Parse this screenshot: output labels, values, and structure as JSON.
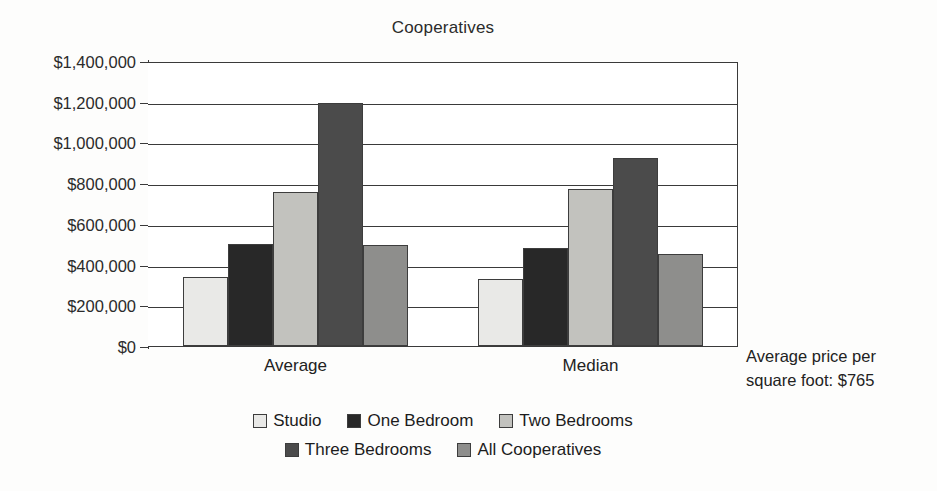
{
  "chart_data": {
    "type": "bar",
    "title": "Cooperatives",
    "xlabel": "",
    "ylabel": "",
    "categories": [
      "Average",
      "Median"
    ],
    "ylim": [
      0,
      1400000
    ],
    "ytick_labels": [
      "$1,400,000",
      "$1,200,000",
      "$1,000,000",
      "$800,000",
      "$600,000",
      "$400,000",
      "$200,000",
      "$0"
    ],
    "ytick_values": [
      1400000,
      1200000,
      1000000,
      800000,
      600000,
      400000,
      200000,
      0
    ],
    "grid": true,
    "legend_position": "bottom",
    "series": [
      {
        "name": "Studio",
        "color": "#e9e9e7",
        "values": [
          340000,
          330000
        ]
      },
      {
        "name": "One Bedroom",
        "color": "#282828",
        "values": [
          500000,
          480000
        ]
      },
      {
        "name": "Two Bedrooms",
        "color": "#c2c2be",
        "values": [
          755000,
          770000
        ]
      },
      {
        "name": "Three Bedrooms",
        "color": "#4b4b4b",
        "values": [
          1195000,
          925000
        ]
      },
      {
        "name": "All Cooperatives",
        "color": "#8e8e8c",
        "values": [
          498000,
          450000
        ]
      }
    ],
    "annotations": [
      {
        "name": "price-per-square-foot",
        "line1": "Average price per",
        "line2": "square foot: $765"
      }
    ]
  }
}
